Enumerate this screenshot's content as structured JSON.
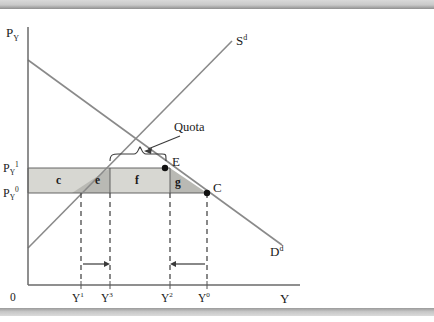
{
  "figure": {
    "type": "economics-supply-demand-quota-diagram",
    "axes": {
      "y_axis_label_base": "P",
      "y_axis_label_sub": "Y",
      "x_axis_label": "Y",
      "origin_label": "0"
    },
    "price_levels": [
      {
        "id": "p1",
        "base": "P",
        "sub": "Y",
        "sup": "1"
      },
      {
        "id": "p0",
        "base": "P",
        "sub": "Y",
        "sup": "0"
      }
    ],
    "quantity_ticks": [
      {
        "id": "y1",
        "base": "Y",
        "sup": "1"
      },
      {
        "id": "y3",
        "base": "Y",
        "sup": "3"
      },
      {
        "id": "y2",
        "base": "Y",
        "sup": "2"
      },
      {
        "id": "y0",
        "base": "Y",
        "sup": "0"
      }
    ],
    "curves": [
      {
        "id": "supply",
        "base": "S",
        "sup": "d"
      },
      {
        "id": "demand",
        "base": "D",
        "sup": "d"
      }
    ],
    "points": [
      {
        "id": "E",
        "label": "E"
      },
      {
        "id": "C",
        "label": "C"
      }
    ],
    "regions": [
      {
        "id": "c",
        "label": "c",
        "shade": "light"
      },
      {
        "id": "e",
        "label": "e",
        "shade": "dark"
      },
      {
        "id": "f",
        "label": "f",
        "shade": "light"
      },
      {
        "id": "g",
        "label": "g",
        "shade": "dark"
      }
    ],
    "annotation": {
      "quota_label": "Quota"
    },
    "colors": {
      "line": "#8a8a8a",
      "axis": "#5a5a5a",
      "shade_light": "#d7d7d2",
      "shade_dark": "#b9b9b4",
      "text": "#1a1a1a",
      "frame": "#c9c9c9"
    }
  }
}
